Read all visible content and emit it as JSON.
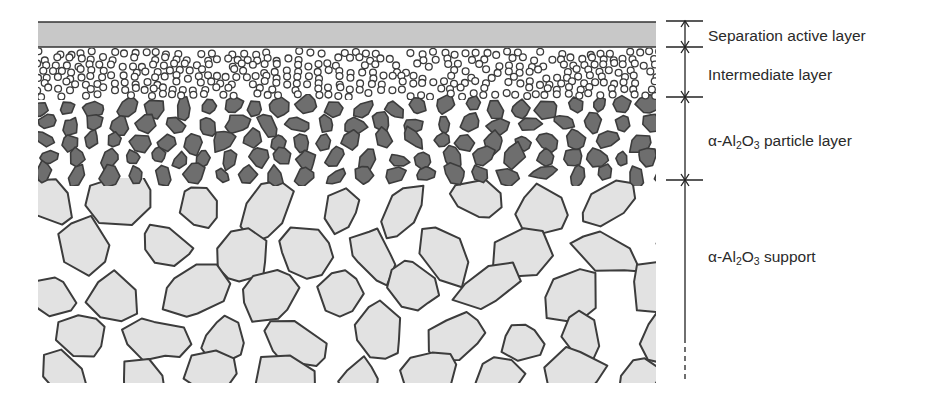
{
  "diagram": {
    "colors": {
      "active_layer_fill": "#c8c8c8",
      "outline": "#3c3c3c",
      "particle_fill": "#6e6e6e",
      "support_fill": "#e2e2e2",
      "background": "#ffffff"
    },
    "layers": [
      {
        "id": "separation-active-layer",
        "label": "Separation active layer",
        "parts": [
          {
            "t": "Separation active layer"
          }
        ],
        "y_top": 22,
        "y_bottom": 47
      },
      {
        "id": "intermediate-layer",
        "label": "Intermediate layer",
        "parts": [
          {
            "t": "Intermediate layer"
          }
        ],
        "y_top": 47,
        "y_bottom": 97
      },
      {
        "id": "particle-layer",
        "label": "α-Al2O3 particle layer",
        "parts": [
          {
            "t": "α-Al"
          },
          {
            "sub": "2"
          },
          {
            "t": "O"
          },
          {
            "sub": "3"
          },
          {
            "t": " particle layer"
          }
        ],
        "y_top": 97,
        "y_bottom": 180
      },
      {
        "id": "support-layer",
        "label": "α-Al2O3 support",
        "parts": [
          {
            "t": "α-Al"
          },
          {
            "sub": "2"
          },
          {
            "t": "O"
          },
          {
            "sub": "3"
          },
          {
            "t": " support"
          }
        ],
        "y_top": 180,
        "y_bottom": 383
      }
    ],
    "label_positions_y": [
      35,
      74,
      140,
      256
    ]
  }
}
